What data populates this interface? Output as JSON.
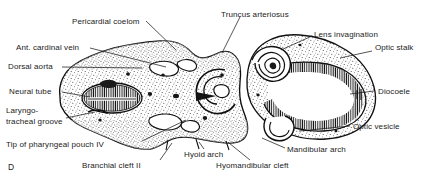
{
  "figure": {
    "panel_id": "D",
    "ink_color": "#1b1b1b",
    "background_color": "#ffffff"
  },
  "labels": [
    {
      "key": "pericardial_coelom",
      "text": "Pericardial coelom",
      "x": 72,
      "y": 17,
      "align": "left"
    },
    {
      "key": "truncus_arteriosus",
      "text": "Truncus arteriosus",
      "x": 221,
      "y": 10,
      "align": "left"
    },
    {
      "key": "lens_invagination",
      "text": "Lens invagination",
      "x": 314,
      "y": 30,
      "align": "left"
    },
    {
      "key": "optic_stalk",
      "text": "Optic stalk",
      "x": 375,
      "y": 47,
      "align": "left"
    },
    {
      "key": "ant_cardinal_vein",
      "text": "Ant. cardinal vein",
      "x": 16,
      "y": 44,
      "align": "left"
    },
    {
      "key": "dorsal_aorta",
      "text": "Dorsal aorta",
      "x": 8,
      "y": 63,
      "align": "left"
    },
    {
      "key": "neural_tube",
      "text": "Neural tube",
      "x": 9,
      "y": 88,
      "align": "left"
    },
    {
      "key": "laryngotracheal_1",
      "text": "Laryngo-",
      "x": 6,
      "y": 108,
      "align": "left"
    },
    {
      "key": "laryngotracheal_2",
      "text": "tracheal groove",
      "x": 6,
      "y": 118,
      "align": "left"
    },
    {
      "key": "tip_pharyngeal_pouch",
      "text": "Tip of pharyngeal pouch IV",
      "x": 6,
      "y": 143,
      "align": "left"
    },
    {
      "key": "branchial_cleft_ii",
      "text": "Branchial cleft II",
      "x": 110,
      "y": 165,
      "align": "left"
    },
    {
      "key": "hyoid_arch",
      "text": "Hyoid arch",
      "x": 192,
      "y": 153,
      "align": "left"
    },
    {
      "key": "hyomandibular_cleft",
      "text": "Hyomandibular cleft",
      "x": 216,
      "y": 165,
      "align": "left"
    },
    {
      "key": "mandibular_arch",
      "text": "Mandibular arch",
      "x": 287,
      "y": 151,
      "align": "left"
    },
    {
      "key": "optic_vesicle",
      "text": "Optic vesicle",
      "x": 353,
      "y": 126,
      "align": "left"
    },
    {
      "key": "diocoele",
      "text": "Diocoele",
      "x": 377,
      "y": 88,
      "align": "left"
    }
  ]
}
